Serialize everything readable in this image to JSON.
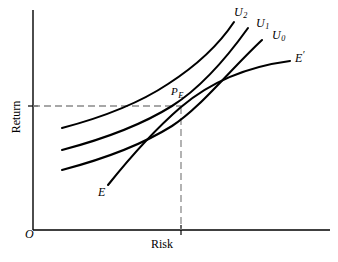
{
  "figure": {
    "background": "#ffffff",
    "ink": "#000000",
    "guide_color": "#8a8a8a"
  },
  "axes": {
    "x_label": "Risk",
    "y_label": "Return",
    "origin_label": "O",
    "x_axis": {
      "x_start": 33,
      "x_end": 330,
      "y": 230
    },
    "y_axis": {
      "x": 33,
      "y_start": 10,
      "y_end": 230
    },
    "x_tick": {
      "x": 181,
      "y": 230
    },
    "y_tick": {
      "x": 33,
      "y": 106
    }
  },
  "labels": {
    "u2": {
      "base": "U",
      "sub": "2"
    },
    "u1": {
      "base": "U",
      "sub": "1"
    },
    "u0": {
      "base": "U",
      "sub": "0"
    },
    "e_prime": {
      "base": "E",
      "prime": "′"
    },
    "p_e": {
      "base": "P",
      "sub": "E"
    },
    "e": "E"
  },
  "chart_data": {
    "type": "line",
    "title": "",
    "xlabel": "Risk",
    "ylabel": "Return",
    "grid": false,
    "legend": "none",
    "xlim": [
      0,
      1
    ],
    "ylim": [
      0,
      1
    ],
    "annotations": [
      {
        "name": "tangency-point",
        "label": "P_E",
        "x": 181,
        "y": 107,
        "note": "optimal portfolio: U1 tangent to efficient frontier"
      },
      {
        "name": "return-projection",
        "from": [
          33,
          106
        ],
        "to": [
          181,
          106
        ],
        "style": "dashed"
      },
      {
        "name": "risk-projection",
        "from": [
          181,
          107
        ],
        "to": [
          181,
          230
        ],
        "style": "dashed"
      }
    ],
    "series": [
      {
        "name": "U0",
        "label": "U₀",
        "kind": "indifference-curve",
        "description": "lowest utility indifference curve, convex to origin",
        "path": "M 62,170 C 100,160 140,146 172,126 C 200,108 228,72 262,40"
      },
      {
        "name": "U1",
        "label": "U₁",
        "kind": "indifference-curve",
        "description": "intermediate utility indifference curve tangent to frontier at P_E",
        "path": "M 62,150 C 100,140 140,126 172,106 C 202,87 228,56 248,28"
      },
      {
        "name": "U2",
        "label": "U₂",
        "kind": "indifference-curve",
        "description": "highest utility indifference curve, unattainable",
        "path": "M 62,128 C 100,118 138,104 168,84 C 196,66 218,46 234,22"
      },
      {
        "name": "EE_prime",
        "label": "E–E′",
        "kind": "efficient-frontier",
        "description": "efficient frontier from E (low risk/return) to E' (high risk/return), concave",
        "path": "M 108,185 C 128,160 152,132 181,107 C 214,79 252,66 290,61"
      }
    ]
  }
}
